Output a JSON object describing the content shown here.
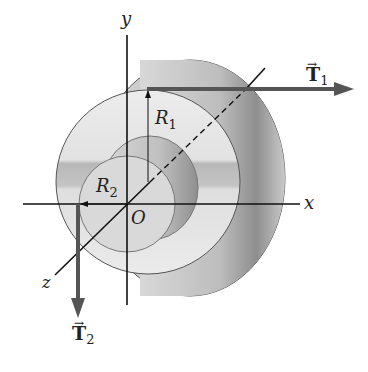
{
  "diagram": {
    "axes": {
      "x_label": "x",
      "y_label": "y",
      "z_label": "z",
      "origin_label": "O"
    },
    "radii": {
      "r1_label": "R",
      "r1_sub": "1",
      "r2_label": "R",
      "r2_sub": "2"
    },
    "forces": {
      "t1_label": "T",
      "t1_sub": "1",
      "t2_label": "T",
      "t2_sub": "2",
      "vector_mark": "→"
    },
    "colors": {
      "arrow": "#555555",
      "line": "#111111",
      "body_light": "#e4e4e4",
      "body_mid": "#c8c8c8",
      "body_dark": "#9a9a9a",
      "band": "#b5b5b5"
    }
  }
}
